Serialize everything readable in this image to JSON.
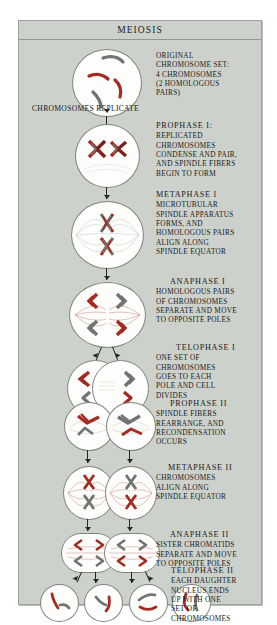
{
  "title": "MEIOSIS",
  "interstitial_label": "CHROMOSOMES REPLICATE",
  "colors": {
    "panel_bg": "#ccd2cb",
    "panel_border": "#9aa29a",
    "cell_fill": "#fdfdfb",
    "cell_border": "#7e857e",
    "chromosome_red": "#a32b22",
    "chromosome_gray": "#6f7570",
    "spindle_red": "#c98a84",
    "spindle_gray": "#a9aeab",
    "text": "#19191b",
    "arrow": "#262626"
  },
  "stages": [
    {
      "id": "original",
      "heading": "",
      "body": [
        "ORIGINAL",
        "CHROMOSOME SET:",
        "4 CHROMOSOMES",
        "(2 HOMOLOGOUS",
        "PAIRS)"
      ],
      "cell_shape": "circle",
      "chromosome_count": 4,
      "chromosomes": "2 red, 2 gray unreplicated"
    },
    {
      "id": "prophase-1",
      "heading": "PROPHASE I:",
      "body": [
        "REPLICATED",
        "CHROMOSOMES",
        "CONDENSE AND PAIR,",
        "AND SPINDLE FIBERS",
        "BEGIN TO FORM"
      ],
      "cell_shape": "circle",
      "chromosome_count": 2,
      "chromosomes": "2 paired bivalents (red + gray)"
    },
    {
      "id": "metaphase-1",
      "heading": "METAPHASE I",
      "body": [
        "MICROTUBULAR",
        "SPINDLE APPARATUS",
        "FORMS, AND",
        "HOMOLOGOUS PAIRS",
        "ALIGN ALONG",
        "SPINDLE EQUATOR"
      ],
      "cell_shape": "oval",
      "chromosome_count": 2,
      "chromosomes": "2 bivalents stacked at equator"
    },
    {
      "id": "anaphase-1",
      "heading": "ANAPHASE I",
      "body": [
        "HOMOLOGOUS PAIRS",
        "OF CHROMOSOMES",
        "SEPARATE AND MOVE",
        "TO OPPOSITE POLES"
      ],
      "cell_shape": "oval",
      "chromosome_count": 4,
      "chromosomes": "4 replicated chromosomes moving apart"
    },
    {
      "id": "telophase-1",
      "heading": "TELOPHASE I",
      "body": [
        "ONE SET OF",
        "CHROMOSOMES",
        "GOES TO EACH",
        "POLE AND CELL",
        "DIVIDES"
      ],
      "cell_shape": "dumbbell",
      "chromosome_count": 4,
      "chromosomes": "2 per lobe"
    },
    {
      "id": "prophase-2",
      "heading": "PROPHASE II",
      "body": [
        "SPINDLE FIBERS",
        "REARRANGE, AND",
        "RECONDENSATION",
        "OCCURS"
      ],
      "cell_shape": "circle-pair",
      "chromosome_count": 2,
      "chromosomes": "2 per cell"
    },
    {
      "id": "metaphase-2",
      "heading": "METAPHASE II",
      "body": [
        "CHROMOSOMES",
        "ALIGN ALONG",
        "SPINDLE EQUATOR"
      ],
      "cell_shape": "oval-pair",
      "chromosome_count": 2,
      "chromosomes": "2 per cell aligned vertically"
    },
    {
      "id": "anaphase-2",
      "heading": "ANAPHASE II",
      "body": [
        "SISTER CHROMATIDS",
        "SEPARATE AND MOVE",
        "TO OPPOSITE POLES"
      ],
      "cell_shape": "rounded-pair",
      "chromosome_count": 4,
      "chromosomes": "4 chromatids per cell at poles"
    },
    {
      "id": "telophase-2",
      "heading": "TELOPHASE II",
      "body": [
        "EACH DAUGHTER",
        "NUCLEUS ENDS",
        "UP WITH ONE",
        "SET OF",
        "CHROMOSOMES"
      ],
      "cell_shape": "circle-quad",
      "chromosome_count": 2,
      "chromosomes": "1 red + 1 gray per daughter cell"
    }
  ]
}
